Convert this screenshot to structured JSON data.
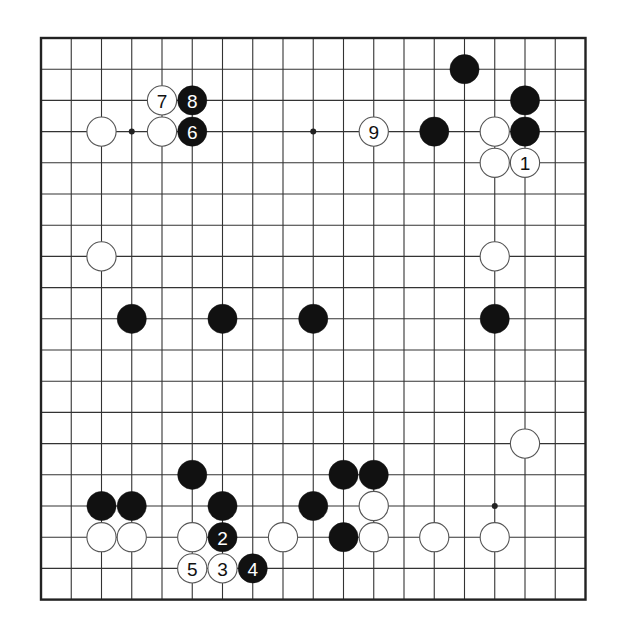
{
  "board": {
    "size": 19,
    "origin_x": 41,
    "origin_y": 38,
    "spacing_x": 30.25,
    "spacing_y": 31.2,
    "stone_radius": 14.6,
    "colors": {
      "background": "#ffffff",
      "line": "#333333",
      "border": "#222222",
      "black_stone": "#111111",
      "white_stone": "#ffffff",
      "white_outline": "#555555",
      "black_label": "#ffffff",
      "white_label": "#111111"
    },
    "hoshi": [
      {
        "col": 3,
        "row": 3
      },
      {
        "col": 9,
        "row": 3
      },
      {
        "col": 15,
        "row": 15
      }
    ],
    "stones": [
      {
        "color": "black",
        "col": 14,
        "row": 1,
        "label": ""
      },
      {
        "color": "black",
        "col": 16,
        "row": 2,
        "label": ""
      },
      {
        "color": "black",
        "col": 16,
        "row": 3,
        "label": ""
      },
      {
        "color": "black",
        "col": 13,
        "row": 3,
        "label": ""
      },
      {
        "color": "white",
        "col": 11,
        "row": 3,
        "label": "9"
      },
      {
        "color": "white",
        "col": 15,
        "row": 3,
        "label": ""
      },
      {
        "color": "white",
        "col": 15,
        "row": 4,
        "label": ""
      },
      {
        "color": "white",
        "col": 16,
        "row": 4,
        "label": "1"
      },
      {
        "color": "white",
        "col": 2,
        "row": 3,
        "label": ""
      },
      {
        "color": "white",
        "col": 4,
        "row": 3,
        "label": ""
      },
      {
        "color": "white",
        "col": 4,
        "row": 2,
        "label": "7"
      },
      {
        "color": "black",
        "col": 5,
        "row": 2,
        "label": "8"
      },
      {
        "color": "black",
        "col": 5,
        "row": 3,
        "label": "6"
      },
      {
        "color": "white",
        "col": 2,
        "row": 7,
        "label": ""
      },
      {
        "color": "white",
        "col": 15,
        "row": 7,
        "label": ""
      },
      {
        "color": "black",
        "col": 3,
        "row": 9,
        "label": ""
      },
      {
        "color": "black",
        "col": 6,
        "row": 9,
        "label": ""
      },
      {
        "color": "black",
        "col": 9,
        "row": 9,
        "label": ""
      },
      {
        "color": "black",
        "col": 15,
        "row": 9,
        "label": ""
      },
      {
        "color": "white",
        "col": 16,
        "row": 13,
        "label": ""
      },
      {
        "color": "black",
        "col": 10,
        "row": 14,
        "label": ""
      },
      {
        "color": "black",
        "col": 11,
        "row": 14,
        "label": ""
      },
      {
        "color": "black",
        "col": 9,
        "row": 15,
        "label": ""
      },
      {
        "color": "white",
        "col": 11,
        "row": 15,
        "label": ""
      },
      {
        "color": "black",
        "col": 10,
        "row": 16,
        "label": ""
      },
      {
        "color": "white",
        "col": 11,
        "row": 16,
        "label": ""
      },
      {
        "color": "white",
        "col": 13,
        "row": 16,
        "label": ""
      },
      {
        "color": "white",
        "col": 15,
        "row": 16,
        "label": ""
      },
      {
        "color": "black",
        "col": 5,
        "row": 14,
        "label": ""
      },
      {
        "color": "black",
        "col": 2,
        "row": 15,
        "label": ""
      },
      {
        "color": "black",
        "col": 3,
        "row": 15,
        "label": ""
      },
      {
        "color": "black",
        "col": 6,
        "row": 15,
        "label": ""
      },
      {
        "color": "white",
        "col": 2,
        "row": 16,
        "label": ""
      },
      {
        "color": "white",
        "col": 3,
        "row": 16,
        "label": ""
      },
      {
        "color": "white",
        "col": 5,
        "row": 16,
        "label": ""
      },
      {
        "color": "black",
        "col": 6,
        "row": 16,
        "label": "2"
      },
      {
        "color": "white",
        "col": 8,
        "row": 16,
        "label": ""
      },
      {
        "color": "white",
        "col": 5,
        "row": 17,
        "label": "5"
      },
      {
        "color": "white",
        "col": 6,
        "row": 17,
        "label": "3"
      },
      {
        "color": "black",
        "col": 7,
        "row": 17,
        "label": "4"
      }
    ]
  }
}
